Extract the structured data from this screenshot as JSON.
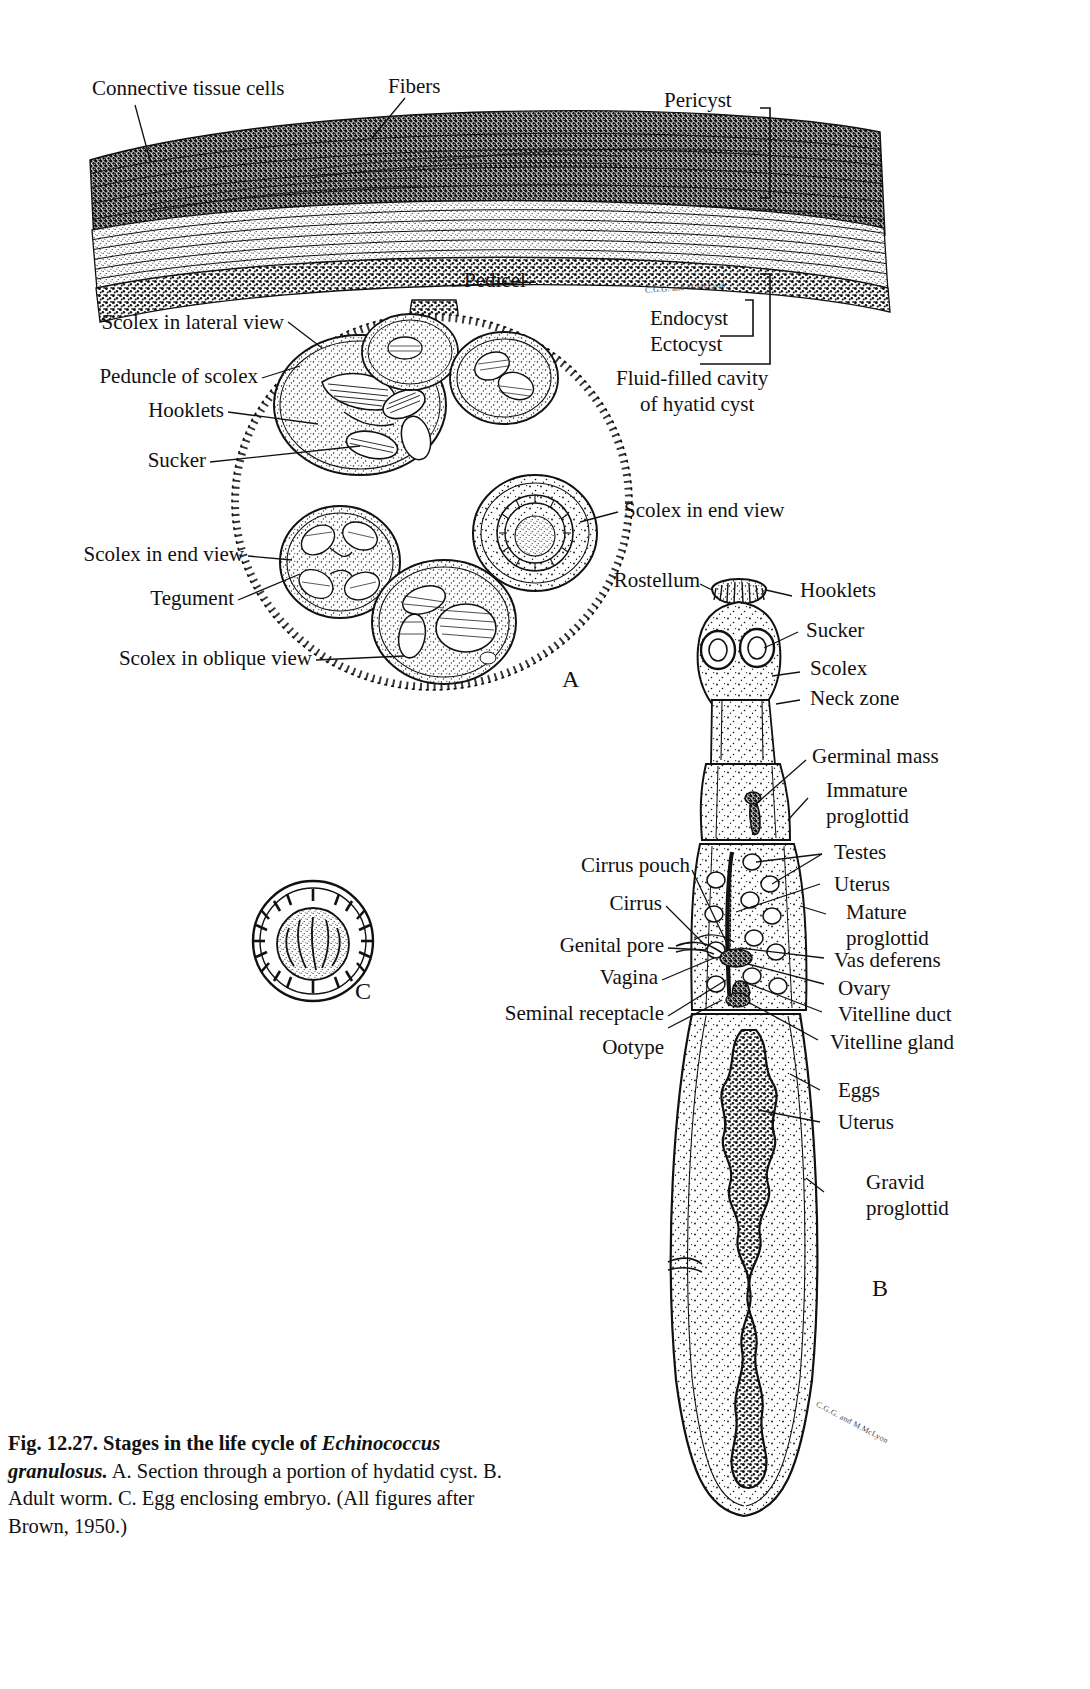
{
  "figure": {
    "number": "Fig. 12.27.",
    "title": "Stages in the life cycle of",
    "species": "Echinococcus granulosus.",
    "caption_a": "A. Section through a portion of hydatid cyst.",
    "caption_b": "B. Adult worm.",
    "caption_c": "C. Egg enclosing embryo. (All figures after",
    "caption_source": "Brown, 1950.)",
    "caption_full": "Fig. 12.27. Stages in the life cycle of Echinococcus granulosus. A. Section through a portion of hydatid cyst. B. Adult worm. C. Egg enclosing embryo. (All figures after Brown, 1950.)"
  },
  "panels": {
    "a": "A",
    "b": "B",
    "c": "C"
  },
  "artist_signature": "C.G.G. and M.McLyon",
  "cyst_wall": {
    "labels": [
      {
        "text": "Connective tissue cells"
      },
      {
        "text": "Fibers"
      },
      {
        "text": "Pericyst"
      },
      {
        "text": "Pedicel"
      },
      {
        "text": "Endocyst"
      },
      {
        "text": "Ectocyst"
      },
      {
        "text": "Fluid-filled cavity"
      },
      {
        "text": "of hyatid cyst"
      }
    ]
  },
  "panel_a_labels": [
    {
      "text": "Scolex in lateral view"
    },
    {
      "text": "Peduncle of scolex"
    },
    {
      "text": "Hooklets"
    },
    {
      "text": "Sucker"
    },
    {
      "text": "Scolex in end view"
    },
    {
      "text": "Tegument"
    },
    {
      "text": "Scolex in oblique view"
    },
    {
      "text": "Scolex in end view"
    }
  ],
  "panel_b_labels_left": [
    {
      "text": "Rostellum"
    },
    {
      "text": "Cirrus pouch"
    },
    {
      "text": "Cirrus"
    },
    {
      "text": "Genital pore"
    },
    {
      "text": "Vagina"
    },
    {
      "text": "Seminal receptacle"
    },
    {
      "text": "Ootype"
    }
  ],
  "panel_b_labels_right": [
    {
      "text": "Hooklets"
    },
    {
      "text": "Sucker"
    },
    {
      "text": "Scolex"
    },
    {
      "text": "Neck zone"
    },
    {
      "text": "Germinal mass"
    },
    {
      "text": "Immature"
    },
    {
      "text": "proglottid"
    },
    {
      "text": "Testes"
    },
    {
      "text": "Uterus"
    },
    {
      "text": "Mature"
    },
    {
      "text": "proglottid"
    },
    {
      "text": "Vas deferens"
    },
    {
      "text": "Ovary"
    },
    {
      "text": "Vitelline duct"
    },
    {
      "text": "Vitelline gland"
    },
    {
      "text": "Eggs"
    },
    {
      "text": "Uterus"
    },
    {
      "text": "Gravid"
    },
    {
      "text": "proglottid"
    }
  ],
  "colors": {
    "ink": "#111111",
    "paper": "#ffffff"
  }
}
